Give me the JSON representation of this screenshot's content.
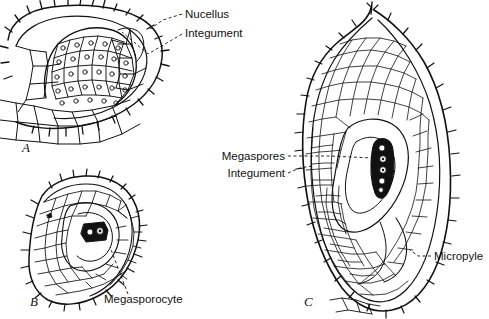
{
  "figure": {
    "background_color": "#ffffff",
    "ink_color": "#111111",
    "width": 489,
    "height": 319
  },
  "panels": [
    {
      "id": "A",
      "label": "A",
      "label_x": 22,
      "label_y": 152,
      "name": "young-ovule-panel",
      "description": "Young ovule in longitudinal section showing nucellus enclosed by developing integument; cells drawn with visible nuclei."
    },
    {
      "id": "B",
      "label": "B",
      "label_x": 30,
      "label_y": 306,
      "name": "megasporocyte-ovule-panel",
      "description": "Ovule with a single darkly stained megasporocyte near the centre, surrounded by nucellar tissue and integument."
    },
    {
      "id": "C",
      "label": "C",
      "label_x": 304,
      "label_y": 306,
      "name": "megaspore-ovule-panel",
      "description": "Mature ovule showing linear tetrad of megaspores, integument and micropyle at the base."
    }
  ],
  "labels": [
    {
      "id": "nucellus",
      "text": "Nucellus",
      "x": 185,
      "y": 18,
      "anchor": "start",
      "panel": "A",
      "leader": [
        [
          182,
          14
        ],
        [
          163,
          20
        ],
        [
          152,
          28
        ]
      ]
    },
    {
      "id": "integument-a",
      "text": "Integument",
      "x": 185,
      "y": 37,
      "anchor": "start",
      "panel": "A",
      "leader": [
        [
          182,
          33
        ],
        [
          146,
          55
        ],
        [
          118,
          33
        ],
        [
          112,
          27
        ]
      ]
    },
    {
      "id": "megasporocyte",
      "text": "Megasporocyte",
      "x": 104,
      "y": 303,
      "anchor": "start",
      "panel": "B",
      "leader": [
        [
          128,
          294
        ],
        [
          118,
          268
        ],
        [
          111,
          248
        ]
      ]
    },
    {
      "id": "megaspores",
      "text": "Megaspores",
      "x": 285,
      "y": 160,
      "anchor": "end",
      "panel": "C",
      "leader": [
        [
          288,
          156
        ],
        [
          310,
          156
        ],
        [
          375,
          158
        ]
      ]
    },
    {
      "id": "integument-c",
      "text": "Integument",
      "x": 285,
      "y": 177,
      "anchor": "end",
      "panel": "C",
      "leader": [
        [
          288,
          173
        ],
        [
          300,
          167
        ],
        [
          313,
          166
        ]
      ]
    },
    {
      "id": "micropyle",
      "text": "Micropyle",
      "x": 434,
      "y": 260,
      "anchor": "start",
      "panel": "C",
      "leader": [
        [
          431,
          256
        ],
        [
          420,
          256
        ],
        [
          413,
          252
        ]
      ]
    }
  ],
  "legend_terms": [
    "Nucellus",
    "Integument",
    "Megasporocyte",
    "Megaspores",
    "Micropyle"
  ]
}
